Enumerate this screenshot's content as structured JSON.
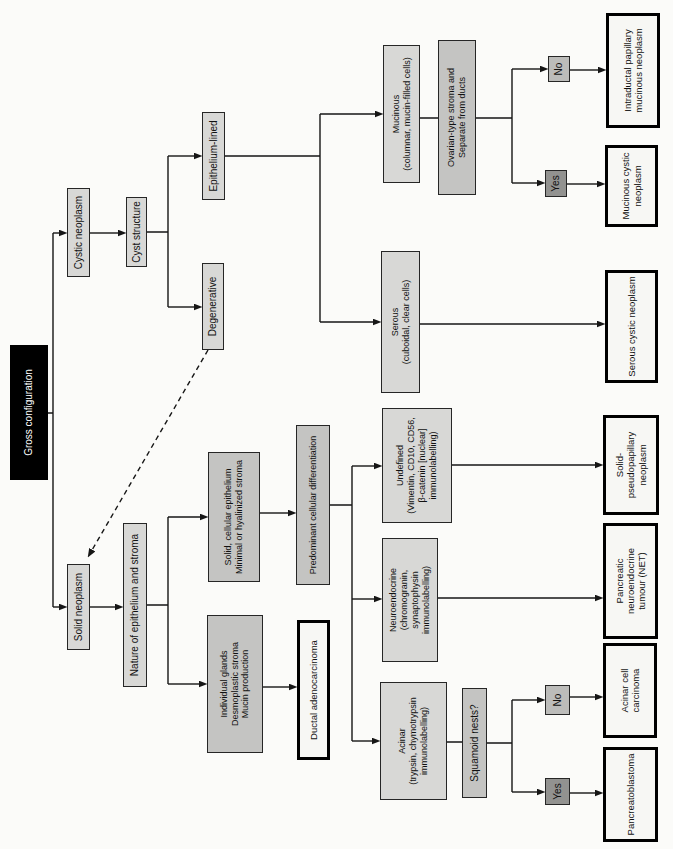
{
  "colors": {
    "box_light": "#d8d8d6",
    "box_medium": "#c4c4c2",
    "yes_fill": "#929290",
    "no_fill": "#bcbcba",
    "outcome_fill": "#f7f7f4",
    "root_fill": "#000000",
    "root_text": "#ffffff",
    "line": "#161616",
    "page_bg": "#fbfbf9"
  },
  "nodes": {
    "gross_configuration": {
      "label": "Gross configuration"
    },
    "solid_neoplasm": {
      "label": "Solid neoplasm"
    },
    "cystic_neoplasm": {
      "label": "Cystic neoplasm"
    },
    "nature_epithelium_stroma": {
      "label": "Nature of epithelium and stroma"
    },
    "cyst_structure": {
      "label": "Cyst structure"
    },
    "individual_glands": {
      "label": "Individual glands\nDesmoplastic stroma\nMucin production"
    },
    "solid_cellular_epithelium": {
      "label": "Solid, cellular epithelium\nMinimal or hyalinized stroma"
    },
    "degenerative": {
      "label": "Degenerative"
    },
    "epithelium_lined": {
      "label": "Epithelium-lined"
    },
    "ductal_adenocarcinoma": {
      "label": "Ductal adenocarcinoma"
    },
    "predominant_cellular_differentiation": {
      "label": "Predominant cellular differentiation"
    },
    "acinar": {
      "label": "Acinar\n(trypsin, chymotrypsin\nimmunolabelling)"
    },
    "neuroendocrine": {
      "label": "Neuroendocrine\n(chromogranin, synaptophysin\nimmunolabelling)"
    },
    "undefined": {
      "label": "Undefined\n(Vimentin, CD10, CD56,\nβ-catenin [nuclear]\nimmunolabelling)"
    },
    "serous": {
      "label": "Serous\n(cuboidal, clear cells)"
    },
    "mucinous": {
      "label": "Mucinous\n(columnar, mucin-filled cells)"
    },
    "ovarian_type_stroma": {
      "label": "Ovarian-type stroma and\nSeparate from ducts"
    },
    "squamoid_nests": {
      "label": "Squamoid nests?"
    },
    "yes_squamoid": {
      "label": "Yes"
    },
    "no_squamoid": {
      "label": "No"
    },
    "yes_ovarian": {
      "label": "Yes"
    },
    "no_ovarian": {
      "label": "No"
    },
    "pancreatoblastoma": {
      "label": "Pancreatoblastoma"
    },
    "acinar_cell_carcinoma": {
      "label": "Acinar cell carcinoma"
    },
    "pancreatic_net": {
      "label": "Pancreatic neuroendocrine\ntumour (NET)"
    },
    "solid_pseudopapillary_neoplasm": {
      "label": "Solid-pseudopapillary\nneoplasm"
    },
    "serous_cystic_neoplasm": {
      "label": "Serous cystic neoplasm"
    },
    "mucinous_cystic_neoplasm": {
      "label": "Mucinous cystic\nneoplasm"
    },
    "intraductal_papillary_mucinous_neoplasm": {
      "label": "Intraductal papillary\nmucinous neoplasm"
    }
  }
}
